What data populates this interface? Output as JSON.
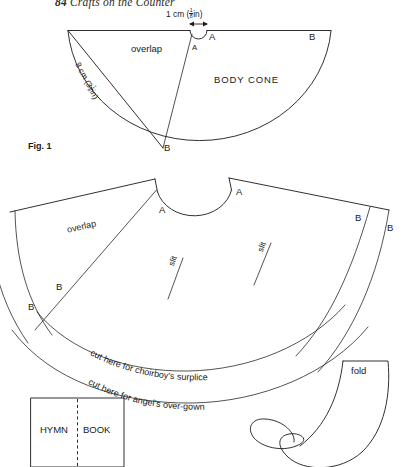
{
  "page": {
    "width": 406,
    "height": 467,
    "background": "#ffffff",
    "ink": "#1a1a1a",
    "running_head": {
      "folio": "84",
      "title": "Crafts on the Counter"
    }
  },
  "figure_top": {
    "caption": "Fig. 1",
    "title": "BODY CONE",
    "overlap_label": "overlap",
    "dimension_top": {
      "metric": "1 cm",
      "imperial_open": "(",
      "imperial_num": "1",
      "imperial_den": "8",
      "imperial_unit": "in",
      "imperial_close": ")"
    },
    "dimension_radius": {
      "metric": "8 cm",
      "imperial_open": "(3",
      "imperial_num": "1",
      "imperial_den": "8",
      "imperial_unit": "in",
      "imperial_close": ")"
    },
    "points": [
      {
        "id": "a-left-inner",
        "label": "A"
      },
      {
        "id": "a-right-outer",
        "label": "A"
      },
      {
        "id": "b-right-top",
        "label": "B"
      },
      {
        "id": "b-apex",
        "label": "B"
      }
    ]
  },
  "figure_bottom": {
    "overlap_label": "overlap",
    "slits": [
      {
        "id": "slit-left",
        "label": "slit"
      },
      {
        "id": "slit-right",
        "label": "slit"
      }
    ],
    "points": [
      {
        "id": "a-neck-left",
        "label": "A"
      },
      {
        "id": "a-neck-right",
        "label": "A"
      },
      {
        "id": "b-right-inner",
        "label": "B"
      },
      {
        "id": "b-right-outer",
        "label": "B"
      },
      {
        "id": "b-left-upper",
        "label": "B"
      },
      {
        "id": "b-left-lower",
        "label": "B"
      }
    ],
    "cut_lines": [
      {
        "id": "cut-surplice",
        "text": "cut here for choirboy's surplice"
      },
      {
        "id": "cut-overgown",
        "text": "cut here for angel's over-gown"
      }
    ]
  },
  "hymn_book": {
    "word_left": "HYMN",
    "word_right": "BOOK",
    "fold_line": "dashed-vertical-fold"
  },
  "wing_piece": {
    "fold_label": "fold"
  }
}
